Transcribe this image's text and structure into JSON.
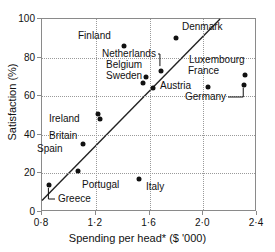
{
  "chart_data": {
    "type": "scatter",
    "title": "",
    "xlabel": "Spending per head* ($ '000)",
    "ylabel": "Satisfaction (%)",
    "xlim": [
      0.8,
      2.4
    ],
    "ylim": [
      0,
      100
    ],
    "xticks": [
      "0·8",
      "1·2",
      "1·6",
      "2·0",
      "2·4"
    ],
    "xtick_values": [
      0.8,
      1.2,
      1.6,
      2.0,
      2.4
    ],
    "yticks": [
      "0",
      "20",
      "40",
      "60",
      "80",
      "100"
    ],
    "ytick_values": [
      0,
      20,
      40,
      60,
      80,
      100
    ],
    "grid": true,
    "legend": "none",
    "points": [
      {
        "label": "Greece",
        "x": 0.855,
        "y": 14,
        "lx": 58,
        "ly": 193,
        "leader": true
      },
      {
        "label": "Portugal",
        "x": 1.07,
        "y": 21,
        "lx": 82,
        "ly": 179,
        "leader": false
      },
      {
        "label": "Spain",
        "x": 1.105,
        "y": 35,
        "lx": 37,
        "ly": 143,
        "leader": false
      },
      {
        "label": "Britain",
        "x": 1.235,
        "y": 48,
        "lx": 49,
        "ly": 130,
        "leader": false
      },
      {
        "label": "Ireland",
        "x": 1.215,
        "y": 51,
        "lx": 49,
        "ly": 113,
        "leader": false
      },
      {
        "label": "Italy",
        "x": 1.525,
        "y": 17,
        "lx": 146,
        "ly": 181,
        "leader": false
      },
      {
        "label": "Finland",
        "x": 1.41,
        "y": 86,
        "lx": 78,
        "ly": 30,
        "leader": false
      },
      {
        "label": "Denmark",
        "x": 1.795,
        "y": 90,
        "lx": 182,
        "ly": 21,
        "leader": false
      },
      {
        "label": "Sweden",
        "x": 1.555,
        "y": 67,
        "lx": 106,
        "ly": 70,
        "leader": false
      },
      {
        "label": "Belgium",
        "x": 1.575,
        "y": 70,
        "lx": 106,
        "ly": 59,
        "leader": false
      },
      {
        "label": "Netherlands",
        "x": 1.685,
        "y": 73,
        "lx": 102,
        "ly": 48,
        "leader": true
      },
      {
        "label": "Austria",
        "x": 1.625,
        "y": 64,
        "lx": 160,
        "ly": 80,
        "leader": false
      },
      {
        "label": "France",
        "x": 2.035,
        "y": 65,
        "lx": 188,
        "ly": 65,
        "leader": false
      },
      {
        "label": "Luxembourg",
        "x": 2.31,
        "y": 71,
        "lx": 189,
        "ly": 54,
        "leader": false
      },
      {
        "label": "Germany",
        "x": 2.305,
        "y": 66,
        "lx": 185,
        "ly": 91,
        "leader": true
      }
    ],
    "trendline": {
      "x1": 0.8,
      "y1": 6,
      "x2": 2.125,
      "y2": 100
    }
  },
  "colors": {
    "point": "#111111",
    "frame": "#8a8a8a",
    "grid": "#9a9a9a",
    "text": "#111111",
    "trend": "#222222"
  }
}
